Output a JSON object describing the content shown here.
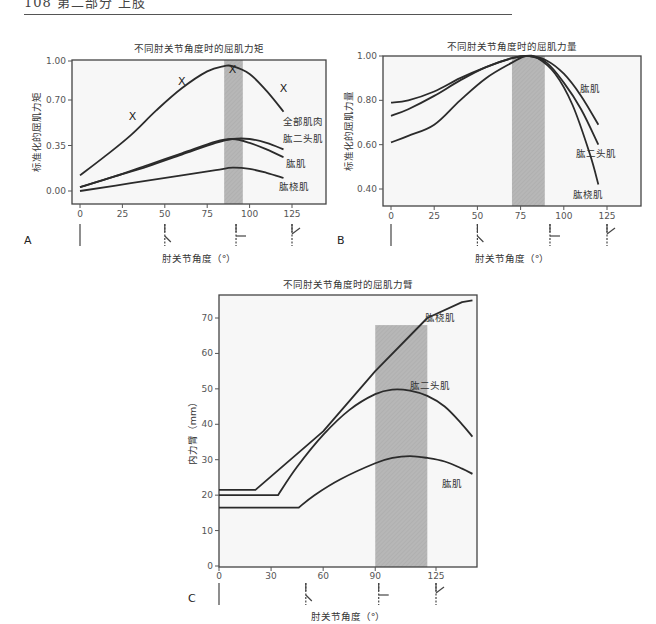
{
  "page": {
    "header_text": "108  第二部分  上肢",
    "rule_color": "#555555"
  },
  "chart_data": [
    {
      "panel": "A",
      "type": "line",
      "title": "不同肘关节角度时的屈肌力矩",
      "xlabel": "肘关节角度（°）",
      "ylabel": "标准化的屈肌力矩",
      "xticks": [
        0,
        25,
        50,
        75,
        100,
        125
      ],
      "yticks": [
        0.0,
        0.35,
        0.7,
        1.0
      ],
      "ytick_labels": [
        "0.00",
        "0.35",
        "0.70",
        "1.00"
      ],
      "xlim": [
        -5,
        145
      ],
      "ylim": [
        -0.05,
        1.02
      ],
      "shaded_band": [
        85,
        96
      ],
      "frame": {
        "x0": 72,
        "y0": 60,
        "x1": 326,
        "y1": 204
      },
      "axis_map": {
        "x": [
          [
            0,
            80
          ],
          [
            125,
            292
          ]
        ],
        "y": [
          [
            0,
            191
          ],
          [
            1,
            61
          ]
        ]
      },
      "series": [
        {
          "name": "全部肌肉",
          "x": [
            0,
            15,
            30,
            45,
            60,
            75,
            85,
            90,
            100,
            110,
            120
          ],
          "y": [
            0.12,
            0.27,
            0.43,
            0.62,
            0.79,
            0.92,
            0.96,
            0.96,
            0.9,
            0.77,
            0.61
          ],
          "label_pos": [
            303,
            125
          ]
        },
        {
          "name": "肱二头肌",
          "x": [
            0,
            20,
            40,
            60,
            80,
            90,
            100,
            110,
            120
          ],
          "y": [
            0.03,
            0.11,
            0.19,
            0.28,
            0.37,
            0.4,
            0.4,
            0.37,
            0.32
          ],
          "label_pos": [
            303,
            142
          ]
        },
        {
          "name": "肱肌",
          "x": [
            0,
            20,
            40,
            60,
            80,
            90,
            100,
            110,
            120
          ],
          "y": [
            0.03,
            0.11,
            0.2,
            0.29,
            0.38,
            0.4,
            0.37,
            0.32,
            0.26
          ],
          "label_pos": [
            296,
            167
          ]
        },
        {
          "name": "肱桡肌",
          "x": [
            0,
            30,
            60,
            80,
            90,
            100,
            110,
            120
          ],
          "y": [
            0.0,
            0.06,
            0.12,
            0.16,
            0.18,
            0.17,
            0.14,
            0.1
          ],
          "label_pos": [
            294,
            190
          ]
        }
      ],
      "markers": {
        "symbol": "X",
        "points": [
          [
            31,
            0.58
          ],
          [
            60,
            0.85
          ],
          [
            90,
            0.94
          ],
          [
            120,
            0.79
          ]
        ]
      },
      "joint_icons_at": [
        0,
        50,
        92,
        125
      ],
      "grid": false
    },
    {
      "panel": "B",
      "type": "line",
      "title": "不同肘关节角度时的屈肌力量",
      "xlabel": "肘关节角度（°）",
      "ylabel": "标准化的屈肌力量",
      "xticks": [
        0,
        25,
        50,
        75,
        100,
        125
      ],
      "yticks": [
        0.4,
        0.6,
        0.8,
        1.0
      ],
      "ytick_labels": [
        "0.40",
        "0.60",
        "0.80",
        "1.00"
      ],
      "xlim": [
        -5,
        145
      ],
      "ylim": [
        0.33,
        1.0
      ],
      "shaded_band": [
        70,
        89
      ],
      "frame": {
        "x0": 383,
        "y0": 56,
        "x1": 641,
        "y1": 206
      },
      "axis_map": {
        "x": [
          [
            0,
            391
          ],
          [
            125,
            607
          ]
        ],
        "y": [
          [
            0.4,
            189
          ],
          [
            1.0,
            56
          ]
        ]
      },
      "series": [
        {
          "name": "肱肌",
          "x": [
            0,
            10,
            25,
            40,
            55,
            70,
            80,
            90,
            100,
            110,
            120
          ],
          "y": [
            0.79,
            0.8,
            0.84,
            0.9,
            0.95,
            0.99,
            1.0,
            0.98,
            0.92,
            0.82,
            0.69
          ],
          "label_pos": [
            590,
            92
          ]
        },
        {
          "name": "肱二头肌",
          "x": [
            0,
            10,
            25,
            40,
            55,
            70,
            80,
            90,
            100,
            110,
            120
          ],
          "y": [
            0.73,
            0.76,
            0.82,
            0.89,
            0.95,
            0.99,
            1.0,
            0.97,
            0.88,
            0.76,
            0.6
          ],
          "label_pos": [
            596,
            157
          ]
        },
        {
          "name": "肱桡肌",
          "x": [
            0,
            10,
            25,
            40,
            55,
            70,
            78,
            85,
            95,
            105,
            115,
            120
          ],
          "y": [
            0.61,
            0.64,
            0.69,
            0.8,
            0.9,
            0.97,
            1.0,
            0.99,
            0.92,
            0.78,
            0.56,
            0.42
          ],
          "label_pos": [
            588,
            198
          ]
        }
      ],
      "joint_icons_at": [
        0,
        50,
        92,
        125
      ],
      "grid": false
    },
    {
      "panel": "C",
      "type": "line",
      "title": "不同肘关节角度时的屈肌力臂",
      "xlabel": "肘关节角度（°）",
      "ylabel": "内力臂（mm）",
      "xticks": [
        0,
        30,
        60,
        90,
        125
      ],
      "yticks": [
        0,
        10,
        20,
        30,
        40,
        50,
        60,
        70
      ],
      "ytick_labels": [
        "0",
        "10",
        "20",
        "30",
        "40",
        "50",
        "60",
        "70"
      ],
      "xlim": [
        0,
        148
      ],
      "ylim": [
        0,
        77
      ],
      "shaded_band": [
        90,
        120
      ],
      "frame": {
        "x0": 219,
        "y0": 295,
        "x1": 477,
        "y1": 567
      },
      "axis_map": {
        "x": [
          [
            0,
            219
          ],
          [
            125,
            436
          ]
        ],
        "y": [
          [
            0,
            566
          ],
          [
            70,
            318
          ]
        ]
      },
      "series": [
        {
          "name": "肱桡肌",
          "x": [
            0,
            21,
            60,
            90,
            120,
            140,
            146
          ],
          "y": [
            21.5,
            21.5,
            38,
            55,
            70,
            74.5,
            75
          ],
          "label_pos": [
            440,
            321
          ]
        },
        {
          "name": "肱二头肌",
          "x": [
            0,
            34,
            45,
            60,
            75,
            90,
            100,
            110,
            120,
            130,
            140,
            146
          ],
          "y": [
            20,
            20,
            28,
            37,
            44,
            48.5,
            49.8,
            49.5,
            48,
            45,
            40,
            36.5
          ],
          "label_pos": [
            430,
            389
          ]
        },
        {
          "name": "肱肌",
          "x": [
            0,
            46,
            55,
            70,
            90,
            100,
            110,
            120,
            130,
            140,
            146
          ],
          "y": [
            16.5,
            16.5,
            20,
            24.5,
            29,
            30.5,
            31,
            30.5,
            29.5,
            27.5,
            26
          ],
          "label_pos": [
            452,
            487
          ]
        }
      ],
      "joint_icons_at": [
        0,
        50,
        92,
        125
      ],
      "grid": false
    }
  ]
}
